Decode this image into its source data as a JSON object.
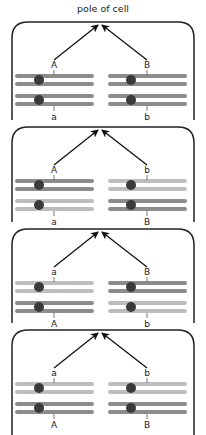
{
  "title": "pole of cell",
  "colors": {
    "dark_chromatid": "#8c8c8c",
    "light_chromatid": "#bdbdbd",
    "centromere": "#3a3a3a",
    "border": "#222222",
    "arrow": "#111111"
  },
  "panels": [
    {
      "left": {
        "top_label": "A",
        "bottom_label": "a",
        "top_shade": "dark",
        "bottom_shade": "dark"
      },
      "right": {
        "top_label": "B",
        "bottom_label": "b",
        "top_shade": "dark",
        "bottom_shade": "dark"
      }
    },
    {
      "left": {
        "top_label": "A",
        "bottom_label": "a",
        "top_shade": "dark",
        "bottom_shade": "light"
      },
      "right": {
        "top_label": "b",
        "bottom_label": "B",
        "top_shade": "light",
        "bottom_shade": "dark"
      }
    },
    {
      "left": {
        "top_label": "a",
        "bottom_label": "A",
        "top_shade": "light",
        "bottom_shade": "dark"
      },
      "right": {
        "top_label": "B",
        "bottom_label": "b",
        "top_shade": "dark",
        "bottom_shade": "light"
      }
    },
    {
      "left": {
        "top_label": "a",
        "bottom_label": "A",
        "top_shade": "light",
        "bottom_shade": "dark"
      },
      "right": {
        "top_label": "b",
        "bottom_label": "B",
        "top_shade": "light",
        "bottom_shade": "dark"
      }
    }
  ]
}
